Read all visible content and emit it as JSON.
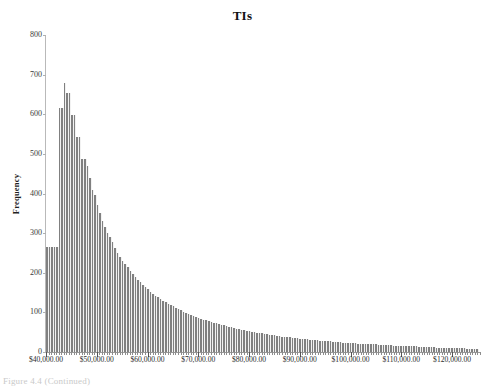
{
  "figure": {
    "caption": "Figure 4.4 (Continued)"
  },
  "chart_data": {
    "type": "bar",
    "title": "TIs",
    "xlabel": "",
    "ylabel": "Frequency",
    "ylim": [
      0,
      800
    ],
    "ytick_labels": [
      "800",
      "700",
      "600",
      "500",
      "400",
      "300",
      "200",
      "100",
      "0"
    ],
    "ytick_values": [
      800,
      700,
      600,
      500,
      400,
      300,
      200,
      100,
      0
    ],
    "grid": false,
    "legend": null,
    "bar_color": "#808080",
    "xlim": [
      40000,
      125500
    ],
    "bin_width": 500,
    "xtick_labels": [
      "$40,000.00",
      "$50,000.00",
      "$60,000.00",
      "$70,000.00",
      "$80,000.00",
      "$90,000.00",
      "$100,000.00",
      "$110,000.00",
      "$120,000.00"
    ],
    "xtick_values": [
      40000,
      50000,
      60000,
      70000,
      80000,
      90000,
      100000,
      110000,
      120000
    ],
    "bin_starts": [
      40000,
      40500,
      41000,
      41500,
      42000,
      42500,
      43000,
      43500,
      44000,
      44500,
      45000,
      45500,
      46000,
      46500,
      47000,
      47500,
      48000,
      48500,
      49000,
      49500,
      50000,
      50500,
      51000,
      51500,
      52000,
      52500,
      53000,
      53500,
      54000,
      54500,
      55000,
      55500,
      56000,
      56500,
      57000,
      57500,
      58000,
      58500,
      59000,
      59500,
      60000,
      60500,
      61000,
      61500,
      62000,
      62500,
      63000,
      63500,
      64000,
      64500,
      65000,
      65500,
      66000,
      66500,
      67000,
      67500,
      68000,
      68500,
      69000,
      69500,
      70000,
      70500,
      71000,
      71500,
      72000,
      72500,
      73000,
      73500,
      74000,
      74500,
      75000,
      75500,
      76000,
      76500,
      77000,
      77500,
      78000,
      78500,
      79000,
      79500,
      80000,
      80500,
      81000,
      81500,
      82000,
      82500,
      83000,
      83500,
      84000,
      84500,
      85000,
      85500,
      86000,
      86500,
      87000,
      87500,
      88000,
      88500,
      89000,
      89500,
      90000,
      90500,
      91000,
      91500,
      92000,
      92500,
      93000,
      93500,
      94000,
      94500,
      95000,
      95500,
      96000,
      96500,
      97000,
      97500,
      98000,
      98500,
      99000,
      99500,
      100000,
      100500,
      101000,
      101500,
      102000,
      102500,
      103000,
      103500,
      104000,
      104500,
      105000,
      105500,
      106000,
      106500,
      107000,
      107500,
      108000,
      108500,
      109000,
      109500,
      110000,
      110500,
      111000,
      111500,
      112000,
      112500,
      113000,
      113500,
      114000,
      114500,
      115000,
      115500,
      116000,
      116500,
      117000,
      117500,
      118000,
      118500,
      119000,
      119500,
      120000,
      120500,
      121000,
      121500,
      122000,
      122500,
      123000,
      123500,
      124000,
      124500,
      125000
    ],
    "values": [
      265,
      265,
      265,
      265,
      265,
      617,
      617,
      680,
      653,
      653,
      597,
      597,
      543,
      543,
      487,
      487,
      470,
      440,
      410,
      395,
      370,
      350,
      330,
      315,
      300,
      290,
      277,
      262,
      250,
      240,
      230,
      222,
      214,
      205,
      197,
      190,
      183,
      176,
      170,
      164,
      158,
      152,
      147,
      142,
      138,
      134,
      130,
      126,
      122,
      118,
      115,
      112,
      108,
      105,
      102,
      99,
      96,
      94,
      91,
      89,
      86,
      84,
      82,
      80,
      78,
      76,
      74,
      72,
      70,
      68,
      67,
      65,
      63,
      62,
      60,
      59,
      57,
      56,
      55,
      53,
      52,
      51,
      50,
      49,
      48,
      47,
      46,
      45,
      44,
      43,
      42,
      41,
      40,
      39,
      38,
      38,
      37,
      36,
      35,
      35,
      34,
      33,
      33,
      32,
      31,
      31,
      30,
      30,
      29,
      28,
      28,
      27,
      27,
      26,
      26,
      25,
      25,
      24,
      24,
      23,
      23,
      22,
      22,
      21,
      21,
      21,
      20,
      20,
      19,
      19,
      19,
      18,
      18,
      18,
      17,
      17,
      17,
      16,
      16,
      16,
      15,
      15,
      15,
      14,
      14,
      14,
      14,
      13,
      13,
      13,
      12,
      12,
      12,
      12,
      11,
      11,
      11,
      11,
      10,
      10,
      10,
      10,
      9,
      9,
      9,
      9,
      8,
      8,
      8,
      8,
      7
    ]
  }
}
